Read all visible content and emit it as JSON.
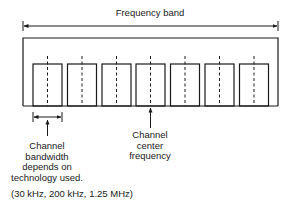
{
  "title": "Frequency band",
  "band": {
    "label": "Frequency band",
    "channel_count": 7
  },
  "annotations": {
    "bandwidth": {
      "line1": "Channel",
      "line2": "bandwidth",
      "line3": "depends on",
      "line4": "technology used."
    },
    "center": {
      "line1": "Channel",
      "line2": "center",
      "line3": "frequency"
    },
    "examples": "(30 kHz, 200 kHz, 1.25 MHz)"
  },
  "colors": {
    "line": "#1a1a1a",
    "background": "#ffffff"
  }
}
